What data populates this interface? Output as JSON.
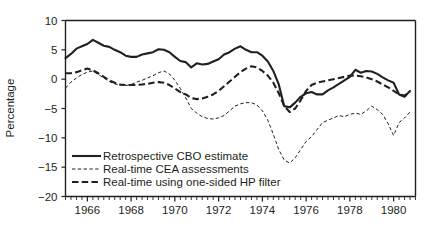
{
  "chart_data": {
    "type": "line",
    "title": "",
    "xlabel": "",
    "ylabel": "Percentage",
    "xlim": [
      1965.0,
      1981.0
    ],
    "ylim": [
      -20,
      10
    ],
    "grid": false,
    "legend_position": "bottom-left-inside",
    "y_ticks": [
      10,
      5,
      0,
      -5,
      -10,
      -15,
      -20
    ],
    "y_tick_labels": [
      "10",
      "5",
      "0",
      "−5",
      "−10",
      "−15",
      "−20"
    ],
    "x_ticks": [
      1966,
      1968,
      1970,
      1972,
      1974,
      1976,
      1978,
      1980
    ],
    "x_tick_labels": [
      "1966",
      "1968",
      "1970",
      "1972",
      "1974",
      "1976",
      "1978",
      "1980"
    ],
    "x_minor_tick_interval": 0.25,
    "x": [
      1965.0,
      1965.25,
      1965.5,
      1965.75,
      1966.0,
      1966.25,
      1966.5,
      1966.75,
      1967.0,
      1967.25,
      1967.5,
      1967.75,
      1968.0,
      1968.25,
      1968.5,
      1968.75,
      1969.0,
      1969.25,
      1969.5,
      1969.75,
      1970.0,
      1970.25,
      1970.5,
      1970.75,
      1971.0,
      1971.25,
      1971.5,
      1971.75,
      1972.0,
      1972.25,
      1972.5,
      1972.75,
      1973.0,
      1973.25,
      1973.5,
      1973.75,
      1974.0,
      1974.25,
      1974.5,
      1974.75,
      1975.0,
      1975.25,
      1975.5,
      1975.75,
      1976.0,
      1976.25,
      1976.5,
      1976.75,
      1977.0,
      1977.25,
      1977.5,
      1977.75,
      1978.0,
      1978.25,
      1978.5,
      1978.75,
      1979.0,
      1979.25,
      1979.5,
      1979.75,
      1980.0,
      1980.25,
      1980.5,
      1980.75
    ],
    "series": [
      {
        "name": "Retrospective CBO estimate",
        "style": "solid",
        "color": "#231f20",
        "values": [
          3.6,
          4.3,
          5.2,
          5.6,
          6.0,
          6.7,
          6.2,
          5.7,
          5.5,
          5.0,
          4.6,
          4.0,
          3.8,
          3.8,
          4.2,
          4.4,
          4.6,
          5.1,
          5.0,
          4.6,
          3.8,
          3.1,
          2.9,
          2.0,
          2.7,
          2.5,
          2.6,
          3.0,
          3.4,
          4.2,
          4.6,
          5.2,
          5.6,
          5.0,
          4.6,
          4.6,
          4.0,
          3.0,
          1.4,
          -0.9,
          -4.6,
          -4.8,
          -4.0,
          -3.0,
          -2.4,
          -2.2,
          -2.6,
          -2.6,
          -1.9,
          -1.4,
          -0.8,
          -0.2,
          0.4,
          1.6,
          1.1,
          1.4,
          1.3,
          0.9,
          0.3,
          -0.2,
          -0.6,
          -2.6,
          -3.0,
          -2.0
        ]
      },
      {
        "name": "Real-time CEA assessments",
        "style": "dotted",
        "color": "#231f20",
        "values": [
          -1.5,
          -0.5,
          0.2,
          0.8,
          1.2,
          1.4,
          0.8,
          0.2,
          -0.4,
          -0.8,
          -1.0,
          -1.1,
          -0.9,
          -0.5,
          -0.2,
          0.2,
          0.6,
          1.1,
          1.4,
          0.9,
          -0.2,
          -1.6,
          -3.2,
          -5.0,
          -5.8,
          -6.4,
          -6.7,
          -6.8,
          -6.6,
          -6.2,
          -5.4,
          -4.6,
          -4.2,
          -4.0,
          -4.0,
          -4.4,
          -5.4,
          -7.0,
          -9.4,
          -12.0,
          -13.8,
          -14.3,
          -13.4,
          -12.0,
          -10.6,
          -9.8,
          -8.6,
          -7.4,
          -7.0,
          -6.6,
          -6.2,
          -6.4,
          -6.0,
          -5.8,
          -6.0,
          -5.4,
          -4.6,
          -5.2,
          -6.0,
          -7.6,
          -9.6,
          -7.4,
          -6.6,
          -5.6
        ]
      },
      {
        "name": "Real-time using one-sided HP filter",
        "style": "dashed",
        "color": "#231f20",
        "values": [
          1.0,
          1.0,
          1.2,
          1.5,
          1.8,
          1.5,
          1.0,
          0.4,
          -0.2,
          -0.6,
          -0.9,
          -1.0,
          -1.0,
          -1.0,
          -0.9,
          -0.8,
          -0.6,
          -0.5,
          -0.6,
          -1.0,
          -1.6,
          -2.2,
          -2.6,
          -3.2,
          -3.4,
          -3.3,
          -3.0,
          -2.6,
          -2.0,
          -1.2,
          -0.4,
          0.4,
          1.2,
          1.8,
          2.2,
          2.0,
          1.4,
          0.6,
          -0.6,
          -2.4,
          -4.6,
          -5.6,
          -5.0,
          -3.6,
          -2.0,
          -1.0,
          -0.6,
          -0.4,
          -0.2,
          0.0,
          0.2,
          0.4,
          0.6,
          0.6,
          0.5,
          0.3,
          0.0,
          -0.4,
          -0.9,
          -1.4,
          -2.0,
          -2.6,
          -2.8,
          -2.1
        ]
      }
    ],
    "legend": [
      {
        "label": "Retrospective CBO estimate",
        "style": "solid"
      },
      {
        "label": "Real-time CEA assessments",
        "style": "dotted"
      },
      {
        "label": "Real-time using one-sided HP filter",
        "style": "dashed"
      }
    ]
  }
}
